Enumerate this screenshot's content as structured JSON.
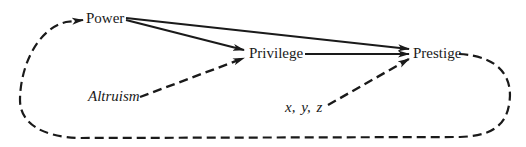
{
  "diagram": {
    "type": "causal-path-diagram",
    "nodes": {
      "power": {
        "label": "Power",
        "italic": false
      },
      "privilege": {
        "label": "Privilege",
        "italic": false
      },
      "prestige": {
        "label": "Prestige",
        "italic": false
      },
      "altruism": {
        "label": "Altruism",
        "italic": true
      },
      "xyz": {
        "label": "x, y, z",
        "italic": true
      }
    },
    "edges": [
      {
        "from": "Power",
        "to": "Privilege",
        "style": "solid"
      },
      {
        "from": "Power",
        "to": "Prestige",
        "style": "solid"
      },
      {
        "from": "Privilege",
        "to": "Prestige",
        "style": "solid"
      },
      {
        "from": "Altruism",
        "to": "Privilege",
        "style": "dashed"
      },
      {
        "from": "x, y, z",
        "to": "Prestige",
        "style": "dashed"
      },
      {
        "from": "Prestige",
        "to": "Power",
        "style": "dashed",
        "shape": "feedback-loop"
      }
    ],
    "colors": {
      "line": "#1a1a1a",
      "text": "#1a1a1a",
      "background": "#ffffff"
    }
  }
}
